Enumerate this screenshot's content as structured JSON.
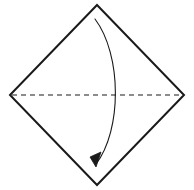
{
  "canvas": {
    "width": 194,
    "height": 190,
    "background_color": "#ffffff",
    "title": "Origami fold diagram"
  },
  "style": {
    "outline_color": "#1a1a1a",
    "outline_width": 2,
    "crease_color": "#1a1a1a",
    "crease_width": 1.1,
    "crease_dash": "5,4",
    "arrow_color": "#1a1a1a",
    "arrow_width": 1.1
  },
  "shape": {
    "name": "square-rotated-45",
    "description": "Square sheet shown as a diamond, corners at top, right, bottom and left",
    "vertices": [
      {
        "label": "top",
        "x": 97,
        "y": 5
      },
      {
        "label": "right",
        "x": 184,
        "y": 95
      },
      {
        "label": "bottom",
        "x": 97,
        "y": 185
      },
      {
        "label": "left",
        "x": 10,
        "y": 95
      }
    ],
    "points_path": "97,5 184,95 97,185 10,95"
  },
  "crease": {
    "name": "horizontal-valley-crease",
    "line_style": "dashed",
    "from": {
      "x": 12,
      "y": 95
    },
    "to": {
      "x": 182,
      "y": 95
    }
  },
  "fold_arrow": {
    "name": "fold-down-arrow",
    "description": "Curved arrow from top corner down to bottom corner indicating the fold direction",
    "start": {
      "x": 95,
      "y": 19
    },
    "end": {
      "x": 96,
      "y": 164
    },
    "control1": {
      "x": 122,
      "y": 55
    },
    "control2": {
      "x": 122,
      "y": 130
    },
    "path": "M 95 19 C 122 55, 122 130, 96 164",
    "arrowhead": {
      "name": "arrowhead-triangle",
      "points": "96,167 101,152 90,157",
      "direction": "down-left"
    }
  }
}
